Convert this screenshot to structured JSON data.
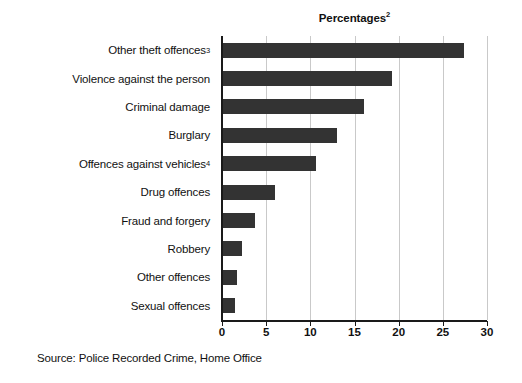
{
  "chart_data": {
    "type": "bar",
    "orientation": "horizontal",
    "title": "Percentages",
    "title_superscript": "2",
    "xlabel": "",
    "ylabel": "",
    "xlim": [
      0,
      30
    ],
    "xticks": [
      0,
      5,
      10,
      15,
      20,
      25,
      30
    ],
    "xtick_labels": [
      "0",
      "5",
      "10",
      "15",
      "20",
      "25",
      "30"
    ],
    "grid": "vertical",
    "legend": "none",
    "bar_color": "#333333",
    "gridline_color": "#c9c9c9",
    "axis_color": "#1a1a1a",
    "categories": [
      "Other theft offences",
      "Violence against the person",
      "Criminal damage",
      "Burglary",
      "Offences against vehicles",
      "Drug offences",
      "Fraud and forgery",
      "Robbery",
      "Other offences",
      "Sexual offences"
    ],
    "category_superscripts": [
      "3",
      "",
      "",
      "",
      "4",
      "",
      "",
      "",
      "",
      ""
    ],
    "values": [
      27.4,
      19.3,
      16.1,
      13.0,
      10.6,
      6.0,
      3.7,
      2.3,
      1.7,
      1.5
    ],
    "source": "Source: Police Recorded Crime, Home Office"
  }
}
